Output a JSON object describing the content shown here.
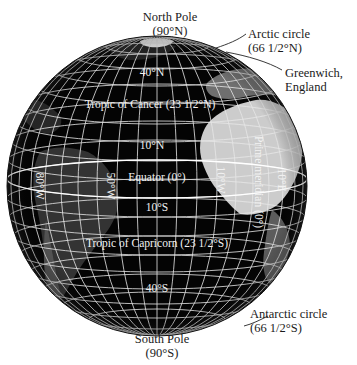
{
  "diagram": {
    "type": "globe-latitude-longitude",
    "background_color": "#ffffff",
    "globe_color": "#060606",
    "grid_color": "#e6e6e6",
    "text_color": "#1a1a1a"
  },
  "external_labels": {
    "north_pole": {
      "line1": "North Pole",
      "line2": "(90°N)"
    },
    "arctic_circle": {
      "line1": "Arctic circle",
      "line2": "(66 1/2°N)"
    },
    "greenwich": {
      "line1": "Greenwich,",
      "line2": "England"
    },
    "antarctic_circle": {
      "line1": "Antarctic circle",
      "line2": "(66 1/2°S)"
    },
    "south_pole": {
      "line1": "South Pole",
      "line2": "(90°S)"
    }
  },
  "parallels": {
    "lat_40n": "40°N",
    "tropic_cancer": "Tropic of Cancer (23 1/2°N)",
    "lat_10n": "10°N",
    "equator": "Equator (0°)",
    "lat_10s": "10°S",
    "tropic_capricorn": "Tropic of Capricorn (23 1/2°S)",
    "lat_40s": "40°S"
  },
  "meridians": {
    "lon_80w": "80°W",
    "lon_50w": "50°W",
    "lon_10w": "10°W",
    "prime_meridian": "Prime meridian (0°)",
    "lon_10e": "10°E"
  }
}
